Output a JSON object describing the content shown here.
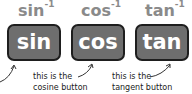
{
  "buttons": [
    {
      "label": "sin",
      "inverse": "sin",
      "inverse_sup": "-1"
    },
    {
      "label": "cos",
      "inverse": "cos",
      "inverse_sup": "-1"
    },
    {
      "label": "tan",
      "inverse": "tan",
      "inverse_sup": "-1"
    }
  ],
  "annotations": [
    {
      "line1": "this is the",
      "line2": "cosine button"
    },
    {
      "line1": "this is the",
      "line2": "tangent button"
    }
  ],
  "colors": {
    "button_fill": "#6e6e6e",
    "button_border": "#1e1e1e",
    "inverse_label": "#8a8a8a"
  }
}
